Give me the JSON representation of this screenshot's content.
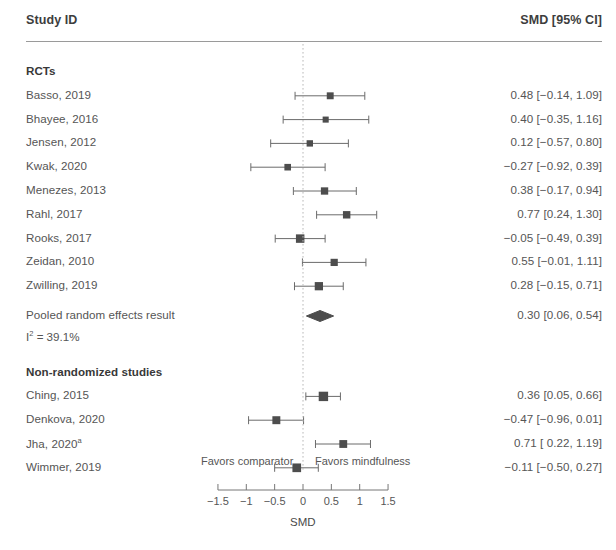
{
  "header": {
    "study_col": "Study ID",
    "effect_col": "SMD [95% CI]"
  },
  "groups": [
    {
      "title": "RCTs"
    },
    {
      "title": "Non-randomized studies"
    }
  ],
  "pooled": {
    "label": "Pooled random effects result",
    "heterogeneity": "I2 = 39.1%",
    "heterogeneity_prefix": "I",
    "heterogeneity_sup": "2",
    "heterogeneity_suffix": " = 39.1%",
    "value_text": "0.30 [0.06, 0.54]"
  },
  "axis": {
    "label": "SMD",
    "left_caption": "Favors comparator",
    "right_caption": "Favors mindfulness",
    "ticks": [
      "−1.5",
      "−1",
      "−0.5",
      "0",
      "0.5",
      "1",
      "1.5"
    ],
    "tick_values": [
      -1.5,
      -1,
      -0.5,
      0,
      0.5,
      1,
      1.5
    ],
    "range": [
      -1.5,
      1.5
    ]
  },
  "colors": {
    "marker": "#4d4d4d",
    "line": "#6b6b6b",
    "text": "#555555",
    "rule": "#9a9a9a",
    "zeroline": "#b8b8b8"
  },
  "chart_data": {
    "type": "forest",
    "title": "",
    "xlabel": "SMD",
    "ylabel": "",
    "xlim": [
      -1.5,
      1.5
    ],
    "grid": false,
    "legend": "none",
    "effect_measure": "SMD",
    "ci_level": "95%",
    "groups": [
      {
        "name": "RCTs",
        "studies": [
          {
            "label": "Basso, 2019",
            "estimate": 0.48,
            "ci_low": -0.14,
            "ci_high": 1.09,
            "weight": 0.52,
            "text": "0.48 [−0.14, 1.09]"
          },
          {
            "label": "Bhayee, 2016",
            "estimate": 0.4,
            "ci_low": -0.35,
            "ci_high": 1.16,
            "weight": 0.36,
            "text": "0.40 [−0.35, 1.16]"
          },
          {
            "label": "Jensen, 2012",
            "estimate": 0.12,
            "ci_low": -0.57,
            "ci_high": 0.8,
            "weight": 0.42,
            "text": "0.12 [−0.57, 0.80]"
          },
          {
            "label": "Kwak, 2020",
            "estimate": -0.27,
            "ci_low": -0.92,
            "ci_high": 0.39,
            "weight": 0.46,
            "text": "−0.27 [−0.92, 0.39]"
          },
          {
            "label": "Menezes, 2013",
            "estimate": 0.38,
            "ci_low": -0.17,
            "ci_high": 0.94,
            "weight": 0.6,
            "text": "0.38 [−0.17, 0.94]"
          },
          {
            "label": "Rahl, 2017",
            "estimate": 0.77,
            "ci_low": 0.24,
            "ci_high": 1.3,
            "weight": 0.62,
            "text": "0.77 [0.24, 1.30]"
          },
          {
            "label": "Rooks, 2017",
            "estimate": -0.05,
            "ci_low": -0.49,
            "ci_high": 0.39,
            "weight": 0.82,
            "text": "−0.05 [−0.49, 0.39]"
          },
          {
            "label": "Zeidan, 2010",
            "estimate": 0.55,
            "ci_low": -0.01,
            "ci_high": 1.11,
            "weight": 0.58,
            "text": "0.55 [−0.01, 1.11]"
          },
          {
            "label": "Zwilling, 2019",
            "estimate": 0.28,
            "ci_low": -0.15,
            "ci_high": 0.71,
            "weight": 0.78,
            "text": "0.28 [−0.15, 0.71]"
          }
        ],
        "pooled": {
          "label": "Pooled random effects result",
          "estimate": 0.3,
          "ci_low": 0.06,
          "ci_high": 0.54,
          "text": "0.30 [0.06, 0.54]",
          "i2": "39.1%"
        }
      },
      {
        "name": "Non-randomized studies",
        "studies": [
          {
            "label": "Ching, 2015",
            "estimate": 0.36,
            "ci_low": 0.05,
            "ci_high": 0.66,
            "weight": 1.0,
            "text": "0.36 [0.05, 0.66]"
          },
          {
            "label": "Denkova, 2020",
            "estimate": -0.47,
            "ci_low": -0.96,
            "ci_high": 0.01,
            "weight": 0.72,
            "text": "−0.47 [−0.96, 0.01]"
          },
          {
            "label": "Jha, 2020",
            "label_sup": "a",
            "estimate": 0.71,
            "ci_low": 0.22,
            "ci_high": 1.19,
            "weight": 0.7,
            "text": "0.71 [ 0.22, 1.19]"
          },
          {
            "label": "Wimmer, 2019",
            "estimate": -0.11,
            "ci_low": -0.5,
            "ci_high": 0.27,
            "weight": 0.86,
            "text": "−0.11 [−0.50, 0.27]"
          }
        ]
      }
    ]
  }
}
